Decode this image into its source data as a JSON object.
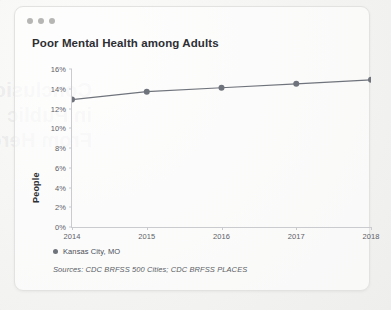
{
  "window": {
    "dots": [
      "window-dot",
      "window-dot",
      "window-dot"
    ]
  },
  "background_showthrough": {
    "line1": "Conclusion—Communication",
    "line2": "in Public Health: Where We Go",
    "line3": "From Here"
  },
  "card": {
    "title": "Poor Mental Health among Adults"
  },
  "legend": {
    "series_label": "Kansas City, MO"
  },
  "footer": {
    "sources": "Sources: CDC BRFSS 500 Cities; CDC BRFSS PLACES"
  },
  "colors": {
    "line": "#6f737b",
    "marker": "#6f737b",
    "axis": "#c9cbce",
    "tick_text": "#5d6168",
    "title_text": "#2d2f34",
    "card_border": "#e2e2e0",
    "page_background": "#f2f2f1"
  },
  "chart_data": {
    "type": "line",
    "title": "Poor Mental Health among Adults",
    "xlabel": "",
    "ylabel": "People",
    "x": [
      2014,
      2015,
      2016,
      2017,
      2018
    ],
    "xtick_labels": [
      "2014",
      "2015",
      "2016",
      "2017",
      "2018"
    ],
    "ytick_labels": [
      "0%",
      "2%",
      "4%",
      "6%",
      "8%",
      "10%",
      "12%",
      "14%",
      "16%"
    ],
    "ytick_values": [
      0,
      2,
      4,
      6,
      8,
      10,
      12,
      14,
      16
    ],
    "ylim": [
      0,
      16
    ],
    "xlim": [
      2014,
      2018
    ],
    "grid": false,
    "legend_position": "bottom-left",
    "units": "percent",
    "series": [
      {
        "name": "Kansas City, MO",
        "values": [
          12.9,
          13.7,
          14.1,
          14.5,
          14.9
        ],
        "color": "#6f737b",
        "marker": "circle"
      }
    ],
    "annotations": [],
    "source_note": "Sources: CDC BRFSS 500 Cities; CDC BRFSS PLACES"
  }
}
